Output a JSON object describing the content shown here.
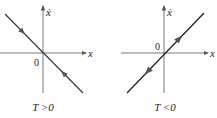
{
  "figure": {
    "panels": [
      {
        "id": "left",
        "axis_x_label": "x",
        "axis_y_label": "ẋ",
        "origin_label": "0",
        "caption": "T >0",
        "line": "negative slope through origin",
        "arrow_direction": "toward origin"
      },
      {
        "id": "right",
        "axis_x_label": "x",
        "axis_y_label": "ẋ",
        "origin_label": "0",
        "caption": "T <0",
        "line": "positive slope through origin",
        "arrow_direction": "away from origin"
      }
    ]
  },
  "colors": {
    "axis": "#555555",
    "line": "#2a2a2a",
    "background": "#ffffff"
  }
}
